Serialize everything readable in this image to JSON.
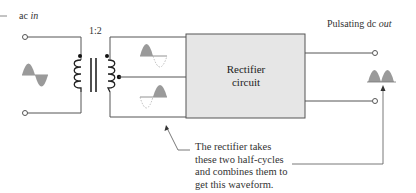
{
  "diagram": {
    "input": {
      "label_prefix": "ac ",
      "label_italic": "in"
    },
    "transformer": {
      "ratio_label": "1:2"
    },
    "rectifier": {
      "line1": "Rectifier",
      "line2": "circuit",
      "fill": "#e6e6e6"
    },
    "output": {
      "label_prefix": "Pulsating dc ",
      "label_italic": "out"
    },
    "note": {
      "lines": [
        "The rectifier takes",
        "these two half-cycles",
        "and combines them to",
        "get this waveform."
      ]
    },
    "colors": {
      "wire": "#555555",
      "waveform_fill": "#9a9a9a",
      "dashed": "#bbbbbb"
    }
  }
}
